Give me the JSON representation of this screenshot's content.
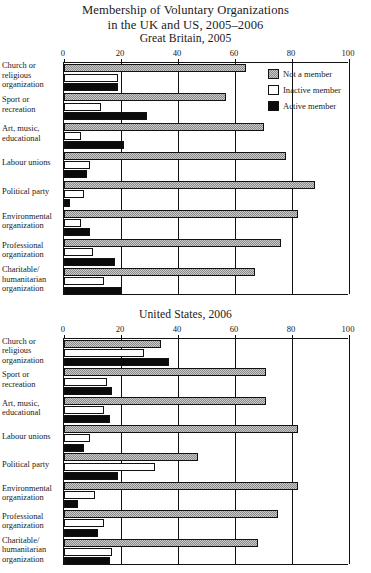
{
  "title": {
    "line1": "Membership of Voluntary Organizations",
    "line2": "in the UK and US, 2005–2006"
  },
  "legend": {
    "items": [
      {
        "label": "Not a member",
        "key": "notmember",
        "color": "#8a8a8a"
      },
      {
        "label": "Inactive member",
        "key": "inactive",
        "color": "#ffffff"
      },
      {
        "label": "Active member",
        "key": "active",
        "color": "#0b0b0b"
      }
    ]
  },
  "chart_data": [
    {
      "type": "bar",
      "orientation": "horizontal",
      "title": "Great Britain, 2005",
      "xlabel": "",
      "ylabel": "",
      "xlim": [
        0,
        100
      ],
      "xticks": [
        0,
        20,
        40,
        60,
        80,
        100
      ],
      "grid": true,
      "legend_position": "top-right",
      "categories": [
        "Church or religious organization",
        "Sport or recreation",
        "Art, music, educational",
        "Labour unions",
        "Political party",
        "Environmental organization",
        "Professional organization",
        "Charitable/ humanitarian organization"
      ],
      "series": [
        {
          "name": "Not a member",
          "values": [
            64,
            57,
            70,
            78,
            88,
            82,
            76,
            67
          ]
        },
        {
          "name": "Inactive member",
          "values": [
            19,
            13,
            6,
            9,
            7,
            6,
            10,
            14
          ]
        },
        {
          "name": "Active member",
          "values": [
            19,
            29,
            21,
            8,
            2,
            9,
            18,
            20
          ]
        }
      ]
    },
    {
      "type": "bar",
      "orientation": "horizontal",
      "title": "United States, 2006",
      "xlabel": "",
      "ylabel": "",
      "xlim": [
        0,
        100
      ],
      "xticks": [
        0,
        20,
        40,
        60,
        80,
        100
      ],
      "grid": true,
      "legend_position": "none",
      "categories": [
        "Church or religious organization",
        "Sport or recreation",
        "Art, music, educational",
        "Labour unions",
        "Political party",
        "Environmental organization",
        "Professional organization",
        "Charitable/ humanitarian organization"
      ],
      "series": [
        {
          "name": "Not a member",
          "values": [
            34,
            71,
            71,
            82,
            47,
            82,
            75,
            68
          ]
        },
        {
          "name": "Inactive member",
          "values": [
            28,
            15,
            14,
            9,
            32,
            11,
            14,
            17
          ]
        },
        {
          "name": "Active member",
          "values": [
            37,
            17,
            16,
            7,
            19,
            5,
            12,
            16
          ]
        }
      ]
    }
  ],
  "categories_display": [
    [
      "Church or",
      "religious",
      "organization"
    ],
    [
      "Sport or",
      "recreation"
    ],
    [
      "Art, music,",
      "educational"
    ],
    [
      "Labour unions"
    ],
    [
      "Political party"
    ],
    [
      "Environmental",
      "organization"
    ],
    [
      "Professional",
      "organization"
    ],
    [
      "Charitable/",
      "humanitarian",
      "organization"
    ]
  ]
}
